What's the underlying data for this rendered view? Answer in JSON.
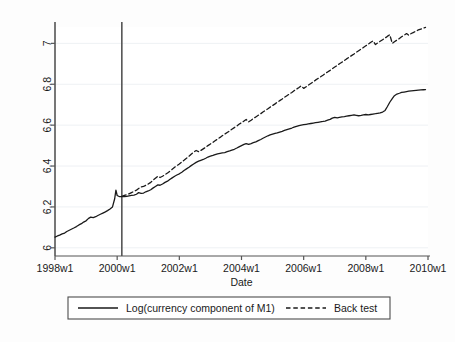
{
  "figure": {
    "background_color": "#fdfdfd",
    "plot_background_color": "#ffffff",
    "line_color": "#1a1a1a",
    "axis_color": "#555555",
    "gridline_color": "#eef1f4"
  },
  "chart_data": {
    "type": "line",
    "title": "",
    "xlabel": "Date",
    "ylabel": "",
    "xlim": [
      1998.0,
      2010.0
    ],
    "ylim": [
      5.96,
      7.08
    ],
    "grid": true,
    "legend_position": "bottom-outside",
    "xticklabels": [
      "1998w1",
      "2000w1",
      "2002w1",
      "2004w1",
      "2006w1",
      "2008w1",
      "2010w1"
    ],
    "xtickvalues": [
      1998,
      2000,
      2002,
      2004,
      2006,
      2008,
      2010
    ],
    "yticklabels": [
      "6",
      "6.2",
      "6.4",
      "6.6",
      "6.8",
      "7"
    ],
    "ytickvalues": [
      6,
      6.2,
      6.4,
      6.6,
      6.8,
      7
    ],
    "annotations": [
      {
        "name": "break-vline",
        "type": "vline",
        "x": 2000.15,
        "label": ""
      }
    ],
    "series": [
      {
        "name": "Log(currency component of M1)",
        "style": "solid",
        "x": [
          1998.0,
          1998.08,
          1998.15,
          1998.23,
          1998.31,
          1998.38,
          1998.46,
          1998.54,
          1998.62,
          1998.69,
          1998.77,
          1998.85,
          1998.92,
          1999.0,
          1999.08,
          1999.15,
          1999.23,
          1999.31,
          1999.38,
          1999.46,
          1999.54,
          1999.62,
          1999.69,
          1999.77,
          1999.85,
          1999.92,
          1999.96,
          2000.0,
          2000.08,
          2000.15,
          2000.23,
          2000.31,
          2000.38,
          2000.46,
          2000.54,
          2000.62,
          2000.69,
          2000.77,
          2000.85,
          2000.92,
          2001.0,
          2001.08,
          2001.15,
          2001.23,
          2001.31,
          2001.38,
          2001.46,
          2001.54,
          2001.62,
          2001.69,
          2001.77,
          2001.85,
          2001.92,
          2002.0,
          2002.08,
          2002.15,
          2002.23,
          2002.31,
          2002.38,
          2002.46,
          2002.54,
          2002.62,
          2002.69,
          2002.77,
          2002.85,
          2002.92,
          2003.0,
          2003.08,
          2003.15,
          2003.23,
          2003.31,
          2003.38,
          2003.46,
          2003.54,
          2003.62,
          2003.69,
          2003.77,
          2003.85,
          2003.92,
          2004.0,
          2004.08,
          2004.15,
          2004.23,
          2004.31,
          2004.38,
          2004.46,
          2004.54,
          2004.62,
          2004.69,
          2004.77,
          2004.85,
          2004.92,
          2005.0,
          2005.08,
          2005.15,
          2005.23,
          2005.31,
          2005.38,
          2005.46,
          2005.54,
          2005.62,
          2005.69,
          2005.77,
          2005.85,
          2005.92,
          2006.0,
          2006.08,
          2006.15,
          2006.23,
          2006.31,
          2006.38,
          2006.46,
          2006.54,
          2006.62,
          2006.69,
          2006.77,
          2006.85,
          2006.92,
          2007.0,
          2007.08,
          2007.15,
          2007.23,
          2007.31,
          2007.38,
          2007.46,
          2007.54,
          2007.62,
          2007.69,
          2007.77,
          2007.85,
          2007.92,
          2008.0,
          2008.08,
          2008.15,
          2008.23,
          2008.31,
          2008.38,
          2008.46,
          2008.54,
          2008.62,
          2008.69,
          2008.77,
          2008.85,
          2008.92,
          2009.0,
          2009.08,
          2009.15,
          2009.23,
          2009.31,
          2009.38,
          2009.46,
          2009.54,
          2009.62,
          2009.69,
          2009.77,
          2009.85,
          2009.92
        ],
        "y": [
          6.052,
          6.058,
          6.062,
          6.068,
          6.072,
          6.08,
          6.086,
          6.092,
          6.098,
          6.104,
          6.112,
          6.118,
          6.126,
          6.132,
          6.144,
          6.15,
          6.148,
          6.152,
          6.158,
          6.164,
          6.17,
          6.176,
          6.182,
          6.19,
          6.2,
          6.24,
          6.282,
          6.256,
          6.25,
          6.25,
          6.251,
          6.252,
          6.254,
          6.256,
          6.258,
          6.262,
          6.27,
          6.266,
          6.268,
          6.274,
          6.278,
          6.284,
          6.292,
          6.3,
          6.308,
          6.306,
          6.312,
          6.32,
          6.326,
          6.334,
          6.342,
          6.35,
          6.356,
          6.362,
          6.37,
          6.378,
          6.386,
          6.394,
          6.402,
          6.41,
          6.418,
          6.424,
          6.428,
          6.432,
          6.438,
          6.444,
          6.448,
          6.452,
          6.456,
          6.46,
          6.462,
          6.464,
          6.466,
          6.47,
          6.474,
          6.478,
          6.482,
          6.488,
          6.494,
          6.5,
          6.506,
          6.51,
          6.506,
          6.51,
          6.514,
          6.518,
          6.524,
          6.53,
          6.536,
          6.542,
          6.548,
          6.552,
          6.556,
          6.56,
          6.562,
          6.566,
          6.57,
          6.574,
          6.578,
          6.582,
          6.586,
          6.59,
          6.594,
          6.598,
          6.6,
          6.602,
          6.604,
          6.606,
          6.608,
          6.61,
          6.612,
          6.614,
          6.616,
          6.618,
          6.62,
          6.624,
          6.628,
          6.634,
          6.638,
          6.636,
          6.638,
          6.64,
          6.642,
          6.644,
          6.646,
          6.648,
          6.65,
          6.648,
          6.646,
          6.648,
          6.65,
          6.652,
          6.65,
          6.652,
          6.654,
          6.656,
          6.658,
          6.66,
          6.664,
          6.672,
          6.69,
          6.712,
          6.73,
          6.744,
          6.752,
          6.756,
          6.76,
          6.762,
          6.764,
          6.766,
          6.768,
          6.769,
          6.77,
          6.771,
          6.772,
          6.773,
          6.774
        ]
      },
      {
        "name": "Back test",
        "style": "dashed",
        "x": [
          2000.15,
          2000.23,
          2000.31,
          2000.38,
          2000.46,
          2000.54,
          2000.62,
          2000.69,
          2000.77,
          2000.85,
          2000.92,
          2001.0,
          2001.08,
          2001.15,
          2001.23,
          2001.31,
          2001.38,
          2001.46,
          2001.54,
          2001.62,
          2001.69,
          2001.77,
          2001.85,
          2001.92,
          2002.0,
          2002.08,
          2002.15,
          2002.23,
          2002.31,
          2002.38,
          2002.46,
          2002.54,
          2002.62,
          2002.69,
          2002.77,
          2002.85,
          2002.92,
          2003.0,
          2003.08,
          2003.15,
          2003.23,
          2003.31,
          2003.38,
          2003.46,
          2003.54,
          2003.62,
          2003.69,
          2003.77,
          2003.85,
          2003.92,
          2004.0,
          2004.08,
          2004.15,
          2004.23,
          2004.31,
          2004.38,
          2004.46,
          2004.54,
          2004.62,
          2004.69,
          2004.77,
          2004.85,
          2004.92,
          2005.0,
          2005.08,
          2005.15,
          2005.23,
          2005.31,
          2005.38,
          2005.46,
          2005.54,
          2005.62,
          2005.69,
          2005.77,
          2005.85,
          2005.92,
          2006.0,
          2006.08,
          2006.15,
          2006.23,
          2006.31,
          2006.38,
          2006.46,
          2006.54,
          2006.62,
          2006.69,
          2006.77,
          2006.85,
          2006.92,
          2007.0,
          2007.08,
          2007.15,
          2007.23,
          2007.31,
          2007.38,
          2007.46,
          2007.54,
          2007.62,
          2007.69,
          2007.77,
          2007.85,
          2007.92,
          2008.0,
          2008.08,
          2008.15,
          2008.23,
          2008.31,
          2008.38,
          2008.46,
          2008.54,
          2008.62,
          2008.69,
          2008.77,
          2008.85,
          2008.92,
          2009.0,
          2009.08,
          2009.15,
          2009.23,
          2009.31,
          2009.38,
          2009.46,
          2009.54,
          2009.62,
          2009.69,
          2009.77,
          2009.85,
          2009.92
        ],
        "y": [
          6.252,
          6.256,
          6.26,
          6.264,
          6.27,
          6.276,
          6.282,
          6.29,
          6.298,
          6.3,
          6.306,
          6.312,
          6.32,
          6.33,
          6.34,
          6.35,
          6.344,
          6.35,
          6.358,
          6.366,
          6.374,
          6.384,
          6.394,
          6.402,
          6.41,
          6.42,
          6.428,
          6.438,
          6.448,
          6.458,
          6.468,
          6.476,
          6.47,
          6.476,
          6.484,
          6.492,
          6.5,
          6.508,
          6.516,
          6.524,
          6.532,
          6.54,
          6.548,
          6.556,
          6.564,
          6.572,
          6.58,
          6.588,
          6.596,
          6.604,
          6.612,
          6.62,
          6.628,
          6.616,
          6.624,
          6.632,
          6.64,
          6.648,
          6.656,
          6.664,
          6.672,
          6.68,
          6.688,
          6.696,
          6.704,
          6.712,
          6.72,
          6.728,
          6.736,
          6.744,
          6.752,
          6.76,
          6.768,
          6.776,
          6.784,
          6.792,
          6.78,
          6.788,
          6.796,
          6.804,
          6.812,
          6.82,
          6.828,
          6.836,
          6.844,
          6.852,
          6.86,
          6.868,
          6.876,
          6.884,
          6.892,
          6.9,
          6.908,
          6.916,
          6.924,
          6.932,
          6.94,
          6.948,
          6.956,
          6.964,
          6.972,
          6.98,
          6.988,
          6.996,
          7.004,
          7.012,
          6.994,
          7.002,
          7.01,
          7.018,
          7.026,
          7.034,
          7.042,
          7.0,
          7.008,
          7.016,
          7.024,
          7.032,
          7.04,
          7.048,
          7.04,
          7.048,
          7.054,
          7.06,
          7.066,
          7.07,
          7.074,
          7.078
        ]
      }
    ]
  },
  "legend": {
    "items": [
      {
        "label": "Log(currency component of M1)",
        "style": "solid"
      },
      {
        "label": "Back test",
        "style": "dashed"
      }
    ]
  }
}
